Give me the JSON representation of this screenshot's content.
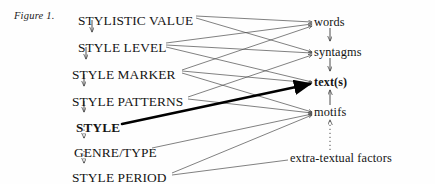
{
  "figure": {
    "caption": "Figure 1.",
    "width": 435,
    "height": 184,
    "ink_color": "#141414",
    "line_color": "#555555",
    "emphasis_color": "#000000"
  },
  "left_column": {
    "title": "stylistic hierarchy",
    "items": [
      {
        "label": "STYLISTIC VALUE",
        "bold": false,
        "x": 78,
        "y": 14
      },
      {
        "label": "STYLE LEVEL",
        "bold": false,
        "x": 78,
        "y": 41
      },
      {
        "label": "STYLE MARKER",
        "bold": false,
        "x": 72,
        "y": 68
      },
      {
        "label": "STYLE PATTERNS",
        "bold": false,
        "x": 72,
        "y": 95
      },
      {
        "label": "STYLE",
        "bold": true,
        "x": 76,
        "y": 121
      },
      {
        "label": "GENRE/TYPE",
        "bold": false,
        "x": 74,
        "y": 146
      },
      {
        "label": "STYLE PERIOD",
        "bold": false,
        "x": 72,
        "y": 171
      }
    ]
  },
  "right_column": {
    "title": "textual units",
    "items": [
      {
        "label": "words",
        "bold": false,
        "x": 314,
        "y": 22
      },
      {
        "label": "syntagms",
        "bold": false,
        "x": 314,
        "y": 52
      },
      {
        "label": "text(s)",
        "bold": true,
        "x": 314,
        "y": 82
      },
      {
        "label": "motifs",
        "bold": false,
        "x": 314,
        "y": 112
      },
      {
        "label": "extra-textual factors",
        "bold": false,
        "x": 290,
        "y": 158
      }
    ]
  },
  "vertical_arrows": {
    "left": [
      {
        "from": "STYLISTIC VALUE",
        "to": "STYLE LEVEL",
        "style": "solid"
      },
      {
        "from": "STYLE LEVEL",
        "to": "STYLE MARKER",
        "style": "solid"
      },
      {
        "from": "STYLE MARKER",
        "to": "STYLE PATTERNS",
        "style": "solid"
      },
      {
        "from": "STYLE PATTERNS",
        "to": "STYLE",
        "style": "solid"
      },
      {
        "from": "STYLE",
        "to": "GENRE/TYPE",
        "style": "dotted"
      },
      {
        "from": "GENRE/TYPE",
        "to": "STYLE PERIOD",
        "style": "dotted"
      }
    ],
    "right": [
      {
        "from": "words",
        "to": "syntagms",
        "style": "solid"
      },
      {
        "from": "syntagms",
        "to": "text(s)",
        "style": "solid"
      },
      {
        "from": "motifs",
        "to": "text(s)",
        "style": "solid"
      },
      {
        "from": "extra-textual factors",
        "to": "motifs",
        "style": "dotted"
      }
    ]
  },
  "cross_links": [
    {
      "from": "STYLISTIC VALUE",
      "to": "words",
      "weight": "thin"
    },
    {
      "from": "STYLISTIC VALUE",
      "to": "syntagms",
      "weight": "thin"
    },
    {
      "from": "STYLE LEVEL",
      "to": "words",
      "weight": "thin"
    },
    {
      "from": "STYLE LEVEL",
      "to": "syntagms",
      "weight": "thin"
    },
    {
      "from": "STYLE LEVEL",
      "to": "text(s)",
      "weight": "thin"
    },
    {
      "from": "STYLE MARKER",
      "to": "words",
      "weight": "thin"
    },
    {
      "from": "STYLE MARKER",
      "to": "text(s)",
      "weight": "thin"
    },
    {
      "from": "STYLE MARKER",
      "to": "motifs",
      "weight": "thin"
    },
    {
      "from": "STYLE PATTERNS",
      "to": "syntagms",
      "weight": "thin"
    },
    {
      "from": "STYLE PATTERNS",
      "to": "motifs",
      "weight": "thin"
    },
    {
      "from": "STYLE",
      "to": "text(s)",
      "weight": "thick"
    },
    {
      "from": "GENRE/TYPE",
      "to": "motifs",
      "weight": "thin"
    },
    {
      "from": "STYLE PERIOD",
      "to": "motifs",
      "weight": "thin"
    },
    {
      "from": "STYLE PERIOD",
      "to": "extra-textual factors",
      "weight": "thin"
    }
  ]
}
